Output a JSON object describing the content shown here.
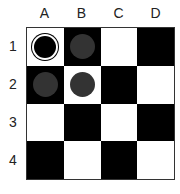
{
  "columns": [
    "A",
    "B",
    "C",
    "D"
  ],
  "rows": [
    "1",
    "2",
    "3",
    "4"
  ],
  "colors": {
    "light": "#ffffff",
    "dark": "#000000",
    "piece_black": "#000000",
    "piece_gray": "#333333"
  },
  "board": [
    [
      {
        "shade": "light",
        "piece": "black"
      },
      {
        "shade": "dark",
        "piece": "gray"
      },
      {
        "shade": "light",
        "piece": null
      },
      {
        "shade": "dark",
        "piece": null
      }
    ],
    [
      {
        "shade": "dark",
        "piece": "gray"
      },
      {
        "shade": "light",
        "piece": "gray"
      },
      {
        "shade": "dark",
        "piece": null
      },
      {
        "shade": "light",
        "piece": null
      }
    ],
    [
      {
        "shade": "light",
        "piece": null
      },
      {
        "shade": "dark",
        "piece": null
      },
      {
        "shade": "light",
        "piece": null
      },
      {
        "shade": "dark",
        "piece": null
      }
    ],
    [
      {
        "shade": "dark",
        "piece": null
      },
      {
        "shade": "light",
        "piece": null
      },
      {
        "shade": "dark",
        "piece": null
      },
      {
        "shade": "light",
        "piece": null
      }
    ]
  ]
}
